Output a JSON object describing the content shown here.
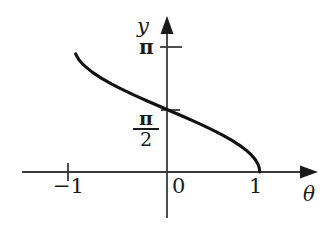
{
  "figure": {
    "background_color": "#ffffff",
    "ink_color": "#1a1a1a",
    "curve_color": "#111111"
  },
  "labels": {
    "y_axis_name": "y",
    "x_axis_name": "θ",
    "y_tick_pi": "π",
    "y_tick_pi_over_2_numerator": "π",
    "y_tick_pi_over_2_denominator": "2",
    "x_tick_neg_one": "−1",
    "x_tick_zero": "0",
    "x_tick_one": "1"
  },
  "chart_data": {
    "type": "line",
    "title": "",
    "subtitle": "",
    "xlabel": "θ",
    "ylabel": "y",
    "function": "y = arccos(θ)",
    "xlim": [
      -1.45,
      1.45
    ],
    "ylim": [
      -0.55,
      3.55
    ],
    "xticks": [
      -1,
      0,
      1
    ],
    "xticklabels": [
      "−1",
      "0",
      "1"
    ],
    "yticks": [
      1.5707963,
      3.1415927
    ],
    "yticklabels": [
      "π/2",
      "π"
    ],
    "grid": false,
    "legend": null,
    "annotations": [],
    "series": [
      {
        "name": "arccos",
        "x": [
          -0.985,
          -0.95,
          -0.9,
          -0.85,
          -0.8,
          -0.7,
          -0.6,
          -0.5,
          -0.4,
          -0.3,
          -0.2,
          -0.1,
          0.0,
          0.1,
          0.2,
          0.3,
          0.4,
          0.5,
          0.6,
          0.7,
          0.8,
          0.85,
          0.9,
          0.95,
          0.98,
          0.995,
          1.0
        ],
        "y": [
          2.968,
          2.8198,
          2.6906,
          2.5913,
          2.4981,
          2.3462,
          2.2143,
          2.0944,
          1.9823,
          1.8755,
          1.7722,
          1.671,
          1.5708,
          1.4706,
          1.3694,
          1.2661,
          1.1593,
          1.0472,
          0.9273,
          0.7954,
          0.6435,
          0.5548,
          0.451,
          0.3176,
          0.2003,
          0.1,
          0.0
        ]
      }
    ]
  }
}
